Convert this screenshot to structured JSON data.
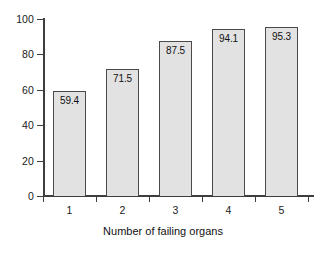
{
  "chart_data": {
    "type": "bar",
    "title": "",
    "subtitle": "",
    "xlabel": "Number of failing organs",
    "ylabel": "",
    "categories": [
      "1",
      "2",
      "3",
      "4",
      "5"
    ],
    "values": [
      59.4,
      71.5,
      87.5,
      94.1,
      95.3
    ],
    "value_labels": [
      "59.4",
      "71.5",
      "87.5",
      "94.1",
      "95.3"
    ],
    "ylim": [
      0,
      100
    ],
    "yticks": [
      0,
      20,
      40,
      60,
      80,
      100
    ],
    "ytick_labels": [
      "0",
      "20",
      "40",
      "60",
      "80",
      "100"
    ],
    "grid": false,
    "legend": null,
    "legend_position": "none",
    "bar_fill_color": "#e2e2e2",
    "bar_edge_color": "#4a4a4a",
    "axis_color": "#3d3d3d",
    "text_color": "#111111",
    "background_color": "#ffffff",
    "value_label_position": "inside-top"
  }
}
